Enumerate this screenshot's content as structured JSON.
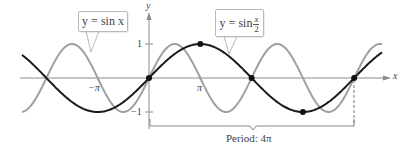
{
  "chart_data": {
    "type": "line",
    "title": "",
    "xlabel": "x",
    "ylabel": "y",
    "x_ticks": [
      "-π",
      "π"
    ],
    "y_ticks": [
      "1",
      "-1"
    ],
    "xlim_pi": [
      -2.47,
      4.55
    ],
    "ylim": [
      -1,
      1
    ],
    "series": [
      {
        "name": "y = sin x",
        "color": "#a0a0a0",
        "function": "sin(x)"
      },
      {
        "name": "y = sin x/2",
        "color": "#1a1a1a",
        "function": "sin(x/2)",
        "key_points": [
          [
            0,
            0
          ],
          [
            3.1416,
            1
          ],
          [
            6.2832,
            0
          ],
          [
            9.4248,
            -1
          ],
          [
            12.5664,
            0
          ]
        ]
      }
    ],
    "annotations": [
      {
        "text": "Period: 4π",
        "type": "bracket",
        "from": 0,
        "to": "4π"
      }
    ]
  },
  "labels": {
    "y_axis": "y",
    "x_axis": "x",
    "tick_pos_pi": "π",
    "tick_neg_pi": "−π",
    "tick_one": "1",
    "tick_neg_one": "−1",
    "callout_sinx": "y = sin x",
    "callout_sinx2_prefix": "y = sin",
    "callout_sinx2_num": "x",
    "callout_sinx2_den": "2",
    "period": "Period: 4π"
  },
  "colors": {
    "sinx": "#a0a0a0",
    "sinx2": "#1a1a1a",
    "axis": "#888888"
  }
}
